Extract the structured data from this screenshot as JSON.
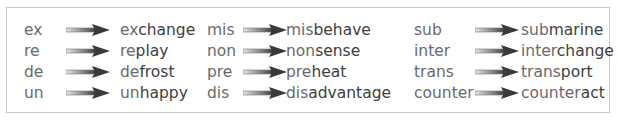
{
  "columns": [
    {
      "items": [
        {
          "prefix": "ex",
          "word_prefix": "ex",
          "word_stem": "change"
        },
        {
          "prefix": "re",
          "word_prefix": "re",
          "word_stem": "play"
        },
        {
          "prefix": "de",
          "word_prefix": "de",
          "word_stem": "frost"
        },
        {
          "prefix": "un",
          "word_prefix": "un",
          "word_stem": "happy"
        }
      ]
    },
    {
      "items": [
        {
          "prefix": "mis",
          "word_prefix": "mis",
          "word_stem": "behave"
        },
        {
          "prefix": "non",
          "word_prefix": "non",
          "word_stem": "sense"
        },
        {
          "prefix": "pre",
          "word_prefix": "pre",
          "word_stem": "heat"
        },
        {
          "prefix": "dis",
          "word_prefix": "dis",
          "word_stem": "advantage"
        }
      ]
    },
    {
      "items": [
        {
          "prefix": "sub",
          "word_prefix": "sub",
          "word_stem": "marine"
        },
        {
          "prefix": "inter",
          "word_prefix": "inter",
          "word_stem": "change"
        },
        {
          "prefix": "trans",
          "word_prefix": "trans",
          "word_stem": "port"
        },
        {
          "prefix": "counter",
          "word_prefix": "counter",
          "word_stem": "act"
        }
      ]
    }
  ],
  "colors": {
    "prefix_text": "#6a6a6a",
    "stem_text": "#404040",
    "arrow_dark": "#3a3a3a",
    "arrow_light": "#e0e0e0",
    "border": "#c8c8c8"
  }
}
